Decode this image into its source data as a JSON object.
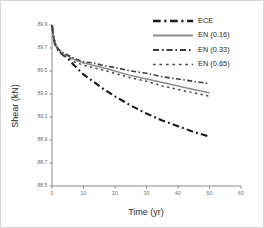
{
  "chart_data": {
    "type": "line",
    "title": "",
    "xlabel": "Time (yr)",
    "ylabel": "Shear (kN)",
    "xlim": [
      0,
      60
    ],
    "ylim": [
      88.5,
      89.9
    ],
    "xticks": [
      0,
      10,
      20,
      30,
      40,
      50,
      60
    ],
    "xtick_labels": [
      "0",
      "10",
      "20",
      "30",
      "40",
      "50",
      "60"
    ],
    "yticks": [
      88.5,
      88.7,
      88.9,
      89.1,
      89.3,
      89.5,
      89.7,
      89.9
    ],
    "ytick_labels": [
      "88.5",
      "88.7",
      "88.9",
      "89.1",
      "89.3",
      "89.5",
      "89.7",
      "89.9"
    ],
    "grid": false,
    "legend_position": "top-right",
    "x": [
      0,
      0.5,
      1,
      2,
      3,
      4,
      5,
      7,
      10,
      13,
      16,
      20,
      25,
      30,
      35,
      40,
      45,
      50
    ],
    "series": [
      {
        "name": "ECE",
        "style": "dash-dot",
        "color": "#1a1a1a",
        "width": 2.1,
        "values": [
          89.9,
          89.79,
          89.73,
          89.68,
          89.65,
          89.63,
          89.61,
          89.55,
          89.47,
          89.41,
          89.35,
          89.28,
          89.2,
          89.13,
          89.07,
          89.02,
          88.97,
          88.93
        ]
      },
      {
        "name": "EN (0.16)",
        "style": "solid",
        "color": "#8c8c8c",
        "width": 1.5,
        "values": [
          89.9,
          89.79,
          89.74,
          89.69,
          89.66,
          89.64,
          89.63,
          89.6,
          89.57,
          89.55,
          89.53,
          89.5,
          89.46,
          89.43,
          89.4,
          89.37,
          89.34,
          89.31
        ]
      },
      {
        "name": "EN (0.33)",
        "style": "dash-dot",
        "color": "#3d3d3d",
        "width": 1.6,
        "values": [
          89.9,
          89.79,
          89.74,
          89.69,
          89.67,
          89.65,
          89.64,
          89.61,
          89.58,
          89.57,
          89.55,
          89.53,
          89.5,
          89.48,
          89.45,
          89.43,
          89.41,
          89.39
        ]
      },
      {
        "name": "EN (0.65)",
        "style": "dotted",
        "color": "#4a4a4a",
        "width": 1.5,
        "values": [
          89.9,
          89.79,
          89.73,
          89.68,
          89.65,
          89.63,
          89.62,
          89.58,
          89.55,
          89.53,
          89.51,
          89.48,
          89.44,
          89.41,
          89.37,
          89.34,
          89.31,
          89.28
        ]
      }
    ],
    "legend": [
      {
        "label": "ECE",
        "style": "dash-dot",
        "color": "#1a1a1a",
        "width": 2.4
      },
      {
        "label": "EN (0.16)",
        "style": "solid",
        "color": "#8c8c8c",
        "width": 1.8
      },
      {
        "label": "EN (0.33)",
        "style": "dash-dot",
        "color": "#3d3d3d",
        "width": 1.9
      },
      {
        "label": "EN (0.65)",
        "style": "dotted",
        "color": "#4a4a4a",
        "width": 1.7
      }
    ]
  }
}
